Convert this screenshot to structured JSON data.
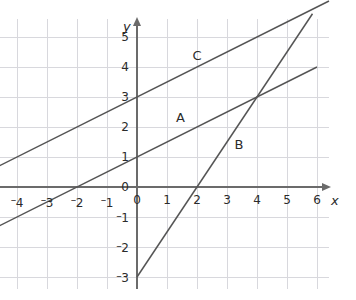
{
  "chart_data": {
    "type": "line",
    "title": "",
    "xlabel": "x",
    "ylabel": "y",
    "xlim": [
      -4.6,
      6.4
    ],
    "ylim": [
      -3.4,
      5.6
    ],
    "grid": true,
    "grid_step": 1,
    "legend": "inline-labels",
    "x_ticks": [
      -4,
      -3,
      -2,
      -1,
      0,
      1,
      2,
      3,
      4,
      5,
      6
    ],
    "x_tick_labels": [
      "-4",
      "-3",
      "-2",
      "-1",
      "0",
      "1",
      "2",
      "3",
      "4",
      "5",
      "6"
    ],
    "y_ticks": [
      -3,
      -2,
      -1,
      0,
      1,
      2,
      3,
      4,
      5
    ],
    "y_tick_labels": [
      "-3",
      "-2",
      "-1",
      "0",
      "1",
      "2",
      "3",
      "4",
      "5"
    ],
    "series": [
      {
        "name": "A",
        "label": "A",
        "slope": 0.5,
        "intercept": 1,
        "x_intercept": -2,
        "equation": "y = 0.5x + 1",
        "x_start": -4.6,
        "x_end": 6,
        "color": "#555555",
        "label_x": 1.45,
        "label_y": 2.35
      },
      {
        "name": "B",
        "label": "B",
        "slope": 1.5,
        "intercept": -3,
        "x_intercept": 2,
        "equation": "y = 1.5x - 3",
        "x_start": 0,
        "x_end": 5.85,
        "color": "#555555",
        "label_x": 3.4,
        "label_y": 1.45
      },
      {
        "name": "C",
        "label": "C",
        "slope": 0.5,
        "intercept": 3,
        "x_intercept": -6,
        "equation": "y = 0.5x + 3",
        "x_start": -4.6,
        "x_end": 6.4,
        "color": "#555555",
        "label_x": 2.0,
        "label_y": 4.4
      }
    ],
    "intersections": [
      {
        "series": [
          "A",
          "B"
        ],
        "x": 4,
        "y": 3
      },
      {
        "series": [
          "B",
          "C"
        ],
        "x": 6,
        "y": 6
      }
    ],
    "colors": {
      "line": "#555555",
      "axis": "#6b6b6b",
      "grid": "#d8d8dd",
      "text": "#2b2b2b",
      "background": "#ffffff"
    }
  },
  "axes": {
    "x_name": "x",
    "y_name": "y",
    "origin_x_label": "0",
    "origin_y_label": "0"
  }
}
